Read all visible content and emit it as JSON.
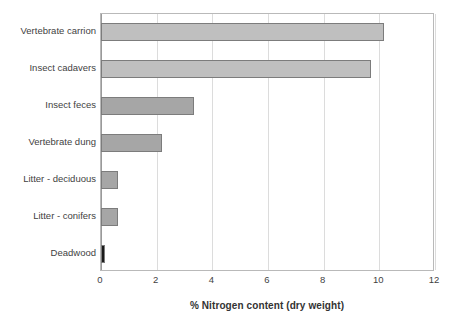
{
  "chart_data": {
    "type": "bar",
    "orientation": "horizontal",
    "title": "",
    "xlabel": "% Nitrogen content (dry weight)",
    "ylabel": "",
    "xlim": [
      0,
      12
    ],
    "xticks": [
      0,
      2,
      4,
      6,
      8,
      10,
      12
    ],
    "xticklabels": [
      "0",
      "2",
      "4",
      "6",
      "8",
      "10",
      "12"
    ],
    "grid": "vertical",
    "legend": "none",
    "categories": [
      "Vertebrate carrion",
      "Insect cadavers",
      "Insect feces",
      "Vertebrate dung",
      "Litter - deciduous",
      "Litter - conifers",
      "Deadwood"
    ],
    "values": [
      10.15,
      9.7,
      3.35,
      2.2,
      0.6,
      0.6,
      0.15
    ],
    "bar_colors": [
      "#bfbfbf",
      "#bfbfbf",
      "#a6a6a6",
      "#a6a6a6",
      "#a6a6a6",
      "#a6a6a6",
      "#1a1a1a"
    ],
    "bar_edge_color": "#7c7c7c",
    "plot_border_color": "#b9b9b9",
    "gridline_color": "#dcdcdc",
    "background_color": "#ffffff",
    "text_color": "#3f3f3f"
  }
}
